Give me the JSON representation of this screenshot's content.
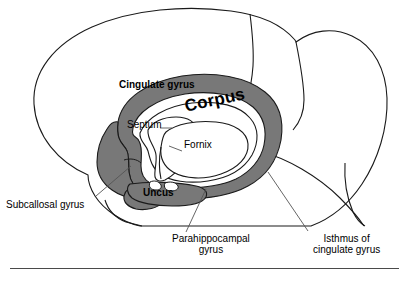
{
  "figure": {
    "type": "anatomical-diagram",
    "colors": {
      "background": "#ffffff",
      "outline": "#1a1a1a",
      "limbic_band_fill": "#787878",
      "limbic_band_stroke": "#1a1a1a",
      "leader_line": "#555555",
      "text": "#000000",
      "rule": "#4a4a4a"
    },
    "labels": {
      "cingulate_gyrus": "Cingulate gyrus",
      "corpus": "Corpus",
      "septum": "Septum",
      "fornix": "Fornix",
      "uncus": "Uncus",
      "subcallosal_gyrus": "Subcallosal gyrus",
      "parahippocampal_line1": "Parahippocampal",
      "parahippocampal_line2": "gyrus",
      "isthmus_line1": "Isthmus of",
      "isthmus_line2": "cingulate gyrus"
    }
  }
}
